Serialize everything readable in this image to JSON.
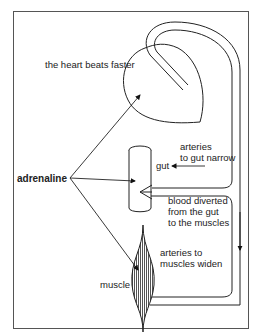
{
  "diagram": {
    "type": "physiology-diagram",
    "labels": {
      "heart": "the heart beats faster",
      "adrenaline": "adrenaline",
      "gut_arteries_1": "arteries",
      "gut_arteries_2": "to gut narrow",
      "gut": "gut",
      "blood_1": "blood diverted",
      "blood_2": "from the gut",
      "blood_3": "to the muscles",
      "muscle_arteries_1": "arteries to",
      "muscle_arteries_2": "muscles widen",
      "muscle": "muscle"
    },
    "nodes": [
      "adrenaline",
      "heart",
      "gut",
      "muscle"
    ],
    "edges": [
      {
        "from": "adrenaline",
        "to": "heart"
      },
      {
        "from": "adrenaline",
        "to": "gut"
      },
      {
        "from": "adrenaline",
        "to": "muscle"
      },
      {
        "from": "heart",
        "to": "gut",
        "via": "artery"
      },
      {
        "from": "gut",
        "to": "muscle",
        "label": "blood diverted from the gut to the muscles"
      }
    ]
  }
}
